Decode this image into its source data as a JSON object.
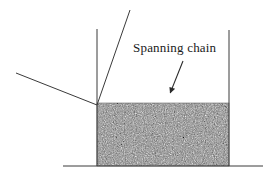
{
  "figure": {
    "background_color": "#ffffff",
    "width": 270,
    "height": 179
  },
  "annotation": {
    "label": "Spanning chain",
    "label_x": 133,
    "label_y": 52,
    "arrow": {
      "from_x": 183,
      "from_y": 61,
      "to_x": 169,
      "to_y": 96,
      "head": "solid-triangle"
    }
  },
  "geometry": {
    "line_color": "#3a3a3a",
    "line_width": 1,
    "baseline": {
      "x1": 63,
      "y1": 166,
      "x2": 263,
      "y2": 166
    },
    "left_wall": {
      "x1": 97,
      "y1": 29,
      "x2": 97,
      "y2": 166
    },
    "right_wall": {
      "x1": 229,
      "y1": 30,
      "x2": 229,
      "y2": 166
    },
    "steep_diagonal": {
      "x1": 130,
      "y1": 10,
      "x2": 97,
      "y2": 105
    },
    "shallow_diagonal": {
      "x1": 16,
      "y1": 73,
      "x2": 97,
      "y2": 105
    }
  },
  "granular_fill": {
    "x": 97,
    "y": 103,
    "width": 132,
    "height": 63,
    "base_color": "#808080",
    "speck_light_color": "#e8e8e8",
    "speck_dark_color": "#3c3c3c",
    "texture": "random-grain-speckle"
  }
}
